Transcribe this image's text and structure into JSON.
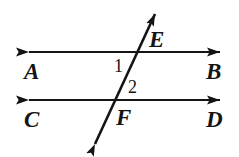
{
  "diagram": {
    "type": "geometry-figure",
    "background_color": "#ffffff",
    "stroke_color": "#141414",
    "lines": [
      {
        "name": "line-AB",
        "kind": "double-headed-arrow",
        "x1": 27,
        "y1": 52,
        "x2": 222,
        "y2": 52,
        "left_label": "A",
        "right_label": "B"
      },
      {
        "name": "line-CD",
        "kind": "double-headed-arrow",
        "x1": 27,
        "y1": 100,
        "x2": 222,
        "y2": 100,
        "left_label": "C",
        "right_label": "D"
      },
      {
        "name": "transversal-EF",
        "kind": "double-headed-arrow",
        "x1": 93,
        "y1": 148,
        "x2": 157,
        "y2": 9,
        "upper_label": "E",
        "lower_label": "F"
      }
    ],
    "intersections": [
      {
        "name": "point-E",
        "label": "E",
        "x": 138,
        "y": 52
      },
      {
        "name": "point-F",
        "label": "F",
        "x": 116,
        "y": 100
      }
    ],
    "angle_labels": [
      {
        "name": "angle-1",
        "label": "1",
        "x": 118,
        "y": 64
      },
      {
        "name": "angle-2",
        "label": "2",
        "x": 132,
        "y": 86
      }
    ],
    "point_labels": [
      {
        "name": "label-A",
        "label": "A"
      },
      {
        "name": "label-B",
        "label": "B"
      },
      {
        "name": "label-C",
        "label": "C"
      },
      {
        "name": "label-D",
        "label": "D"
      },
      {
        "name": "label-E",
        "label": "E"
      },
      {
        "name": "label-F",
        "label": "F"
      }
    ]
  }
}
